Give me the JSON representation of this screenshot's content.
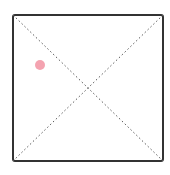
{
  "canvas": {
    "width": 170,
    "height": 175,
    "background": "#ffffff"
  },
  "frame": {
    "x": 13,
    "y": 15,
    "width": 150,
    "height": 146,
    "stroke": "#333333",
    "stroke_width": 2,
    "radius": 2
  },
  "diagonals": {
    "stroke": "#555555",
    "dash": "1.5 2.5",
    "stroke_width": 1
  },
  "marker": {
    "cx": 40,
    "cy": 65,
    "r": 5,
    "color": "#f4a3b0"
  }
}
